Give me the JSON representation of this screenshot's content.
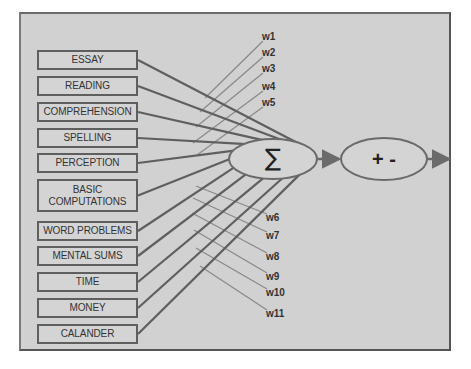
{
  "diagram": {
    "inputs": [
      {
        "label": "ESSAY",
        "top": 50,
        "height": 20
      },
      {
        "label": "READING",
        "top": 76,
        "height": 20
      },
      {
        "label": "COMPREHENSION",
        "top": 102,
        "height": 20
      },
      {
        "label": "SPELLING",
        "top": 128,
        "height": 20
      },
      {
        "label": "PERCEPTION",
        "top": 153,
        "height": 20
      },
      {
        "label": "BASIC\nCOMPUTATIONS",
        "top": 179,
        "height": 33
      },
      {
        "label": "WORD PROBLEMS",
        "top": 221,
        "height": 20
      },
      {
        "label": "MENTAL  SUMS",
        "top": 246,
        "height": 20
      },
      {
        "label": "TIME",
        "top": 272,
        "height": 20
      },
      {
        "label": "MONEY",
        "top": 298,
        "height": 20
      },
      {
        "label": "CALANDER",
        "top": 324,
        "height": 20
      }
    ],
    "weights": [
      {
        "label": "w1",
        "x": 262,
        "y": 31
      },
      {
        "label": "w2",
        "x": 262,
        "y": 47
      },
      {
        "label": "w3",
        "x": 262,
        "y": 63
      },
      {
        "label": "w4",
        "x": 262,
        "y": 81
      },
      {
        "label": "w5",
        "x": 262,
        "y": 97
      },
      {
        "label": "w6",
        "x": 266,
        "y": 212
      },
      {
        "label": "w7",
        "x": 266,
        "y": 230
      },
      {
        "label": "w8",
        "x": 266,
        "y": 251
      },
      {
        "label": "w9",
        "x": 266,
        "y": 271
      },
      {
        "label": "w10",
        "x": 266,
        "y": 287
      },
      {
        "label": "w11",
        "x": 266,
        "y": 308
      }
    ],
    "summation_node": {
      "symbol": "∑"
    },
    "threshold_node": {
      "symbol": "+ -"
    }
  }
}
